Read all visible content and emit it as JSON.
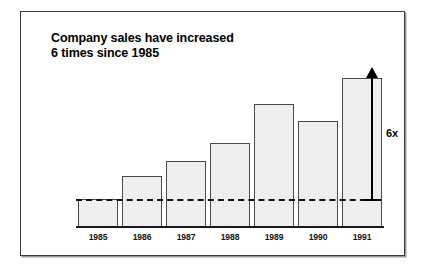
{
  "figure": {
    "title": "Company sales have increased\n6 times since 1985",
    "frame_border_color": "#3a3a3a",
    "background_color": "#ffffff"
  },
  "annotation": {
    "growth_label": "6x",
    "arrow_direction": "up",
    "reference_line_style": "dashed",
    "reference_line_year": "1985"
  },
  "chart_data": {
    "type": "bar",
    "title": "Company sales have increased 6 times since 1985",
    "xlabel": "",
    "ylabel": "",
    "categories": [
      "1985",
      "1986",
      "1987",
      "1988",
      "1989",
      "1990",
      "1991"
    ],
    "values": [
      27,
      50,
      65,
      83,
      122,
      105,
      148
    ],
    "ylim": [
      0,
      174
    ],
    "grid": false,
    "legend": null,
    "bar_fill_color": "#efefef",
    "bar_edge_color": "#4a4a4a",
    "axis_color": "#1a1a1a",
    "annotations": [
      {
        "text": "6x",
        "kind": "growth-arrow",
        "from_category": "1985",
        "to_category": "1991",
        "baseline_value": 27,
        "top_value": 148
      }
    ]
  }
}
